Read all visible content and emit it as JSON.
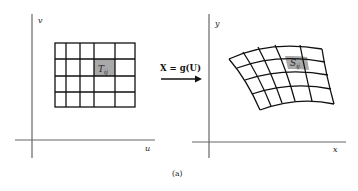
{
  "figure": {
    "caption": "(a)",
    "mapping_label": "X = g(U)",
    "left_panel": {
      "x_axis_label": "u",
      "y_axis_label": "v",
      "grid": {
        "columns": 5,
        "rows": 4
      },
      "highlight_cell_label": "T",
      "highlight_cell_subscript": "ij",
      "highlight_color": "#a9a9a9"
    },
    "right_panel": {
      "x_axis_label": "x",
      "y_axis_label": "y",
      "grid": {
        "columns": 5,
        "rows": 4
      },
      "highlight_cell_label": "S",
      "highlight_cell_subscript": "ij",
      "highlight_color": "#a9a9a9"
    },
    "colors": {
      "line": "#111111",
      "axis": "#555555",
      "background": "#ffffff"
    }
  }
}
